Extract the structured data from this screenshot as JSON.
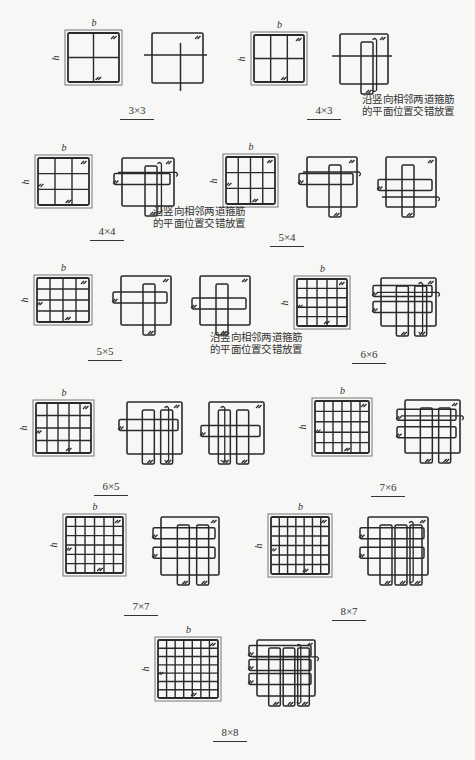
{
  "figure": {
    "kind": "column-stirrup-configurations",
    "dimension_labels": {
      "width": "b",
      "height": "h"
    },
    "note": [
      "沿竖向相邻两道箍筋",
      "的平面位置交错放置"
    ],
    "panels": [
      {
        "id": "3x3",
        "label": "3×3",
        "nx": 3,
        "ny": 3,
        "alternating": false,
        "section": [
          65,
          30,
          57,
          55
        ],
        "stirrups": [
          [
            152,
            33,
            51,
            50
          ]
        ],
        "label_pos": [
          137,
          104
        ]
      },
      {
        "id": "4x3",
        "label": "4×3",
        "nx": 4,
        "ny": 3,
        "alternating": false,
        "section": [
          251,
          32,
          56,
          53
        ],
        "stirrups": [
          [
            340,
            34,
            48,
            50
          ]
        ],
        "label_pos": [
          324,
          104
        ]
      },
      {
        "id": "4x4",
        "label": "4×4",
        "nx": 4,
        "ny": 4,
        "alternating": false,
        "section": [
          35,
          155,
          57,
          53
        ],
        "stirrups": [
          [
            122,
            158,
            52,
            48
          ]
        ],
        "label_pos": [
          107,
          225
        ]
      },
      {
        "id": "5x4",
        "label": "5×4",
        "nx": 5,
        "ny": 4,
        "alternating": true,
        "section": [
          223,
          154,
          55,
          53
        ],
        "stirrups": [
          [
            307,
            157,
            50,
            50
          ],
          [
            386,
            157,
            50,
            50
          ]
        ],
        "label_pos": [
          287,
          231
        ]
      },
      {
        "id": "5x5",
        "label": "5×5",
        "nx": 5,
        "ny": 5,
        "alternating": true,
        "section": [
          34,
          275,
          58,
          50
        ],
        "stirrups": [
          [
            121,
            276,
            50,
            49
          ],
          [
            200,
            276,
            50,
            49
          ]
        ],
        "label_pos": [
          105,
          345
        ]
      },
      {
        "id": "6x6",
        "label": "6×6",
        "nx": 6,
        "ny": 6,
        "alternating": false,
        "section": [
          294,
          276,
          56,
          53
        ],
        "stirrups": [
          [
            381,
            278,
            55,
            48
          ]
        ],
        "label_pos": [
          369,
          348
        ]
      },
      {
        "id": "6x5",
        "label": "6×5",
        "nx": 6,
        "ny": 5,
        "alternating": true,
        "section": [
          33,
          400,
          61,
          56
        ],
        "stirrups": [
          [
            127,
            402,
            55,
            52
          ],
          [
            209,
            402,
            55,
            52
          ]
        ],
        "label_pos": [
          111,
          480
        ]
      },
      {
        "id": "7x6",
        "label": "7×6",
        "nx": 7,
        "ny": 6,
        "alternating": false,
        "section": [
          312,
          398,
          60,
          58
        ],
        "stirrups": [
          [
            405,
            400,
            55,
            53
          ]
        ],
        "label_pos": [
          388,
          481
        ]
      },
      {
        "id": "7x7",
        "label": "7×7",
        "nx": 7,
        "ny": 7,
        "alternating": false,
        "section": [
          63,
          514,
          63,
          62
        ],
        "stirrups": [
          [
            161,
            517,
            58,
            58
          ]
        ],
        "label_pos": [
          141,
          600
        ]
      },
      {
        "id": "8x7",
        "label": "8×7",
        "nx": 8,
        "ny": 7,
        "alternating": false,
        "section": [
          268,
          514,
          64,
          63
        ],
        "stirrups": [
          [
            368,
            517,
            60,
            58
          ]
        ],
        "label_pos": [
          349,
          605
        ]
      },
      {
        "id": "8x8",
        "label": "8×8",
        "nx": 8,
        "ny": 8,
        "alternating": false,
        "section": [
          155,
          637,
          66,
          64
        ],
        "stirrups": [
          [
            257,
            640,
            58,
            56
          ]
        ],
        "label_pos": [
          230,
          726
        ]
      }
    ],
    "notes_pos": [
      [
        362,
        94
      ],
      [
        153,
        206
      ],
      [
        210,
        332
      ]
    ]
  }
}
